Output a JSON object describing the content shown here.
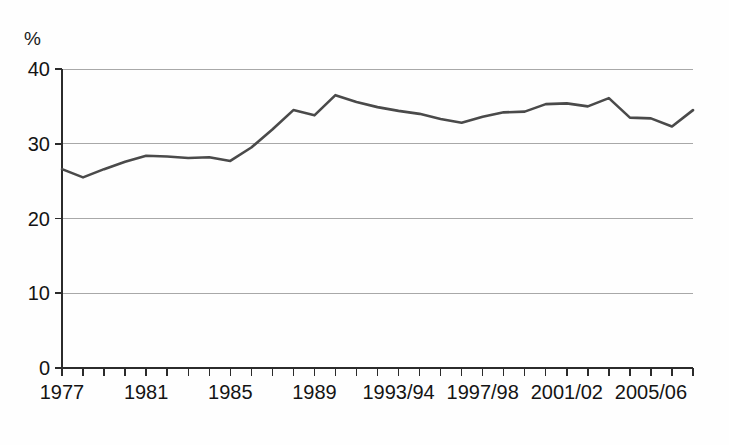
{
  "chart_data": {
    "type": "line",
    "title": "",
    "subtitle": "",
    "xlabel": "",
    "ylabel": "%",
    "ylim": [
      0,
      40
    ],
    "yticks": [
      0,
      10,
      20,
      30,
      40
    ],
    "ytick_labels": [
      "0",
      "10",
      "20",
      "30",
      "40"
    ],
    "grid": true,
    "legend": "none",
    "x_axis_note": "annual ticks, every 4th labelled; later years labelled as academic/financial year spans",
    "xtick_labels": [
      "1977",
      "1981",
      "1985",
      "1989",
      "1993/94",
      "1997/98",
      "2001/02",
      "2005/06"
    ],
    "xtick_label_years": [
      1977,
      1981,
      1985,
      1989,
      1993,
      1997,
      2001,
      2005
    ],
    "x": [
      1977,
      1978,
      1979,
      1980,
      1981,
      1982,
      1983,
      1984,
      1985,
      1986,
      1987,
      1988,
      1989,
      1990,
      1991,
      1992,
      1993,
      1994,
      1995,
      1996,
      1997,
      1998,
      1999,
      2000,
      2001,
      2002,
      2003,
      2004,
      2005,
      2006,
      2007
    ],
    "x_labels_full": [
      "1977",
      "1978",
      "1979",
      "1980",
      "1981",
      "1982",
      "1983",
      "1984",
      "1985",
      "1986",
      "1987",
      "1988",
      "1989",
      "1990",
      "1991",
      "1992",
      "1993/94",
      "1994/95",
      "1995/96",
      "1996/97",
      "1997/98",
      "1998/99",
      "1999/00",
      "2000/01",
      "2001/02",
      "2002/03",
      "2003/04",
      "2004/05",
      "2005/06",
      "2006/07",
      "2007/08"
    ],
    "values": [
      26.6,
      25.5,
      26.6,
      27.6,
      28.4,
      28.3,
      28.1,
      28.2,
      27.7,
      29.5,
      31.9,
      34.5,
      33.8,
      36.5,
      35.6,
      34.9,
      34.4,
      34.0,
      33.3,
      32.8,
      33.6,
      34.2,
      34.3,
      35.3,
      35.4,
      35.0,
      36.1,
      33.5,
      33.4,
      32.3,
      34.5
    ],
    "series": [
      {
        "name": "percentage",
        "color": "#4a4a4a",
        "values": [
          26.6,
          25.5,
          26.6,
          27.6,
          28.4,
          28.3,
          28.1,
          28.2,
          27.7,
          29.5,
          31.9,
          34.5,
          33.8,
          36.5,
          35.6,
          34.9,
          34.4,
          34.0,
          33.3,
          32.8,
          33.6,
          34.2,
          34.3,
          35.3,
          35.4,
          35.0,
          36.1,
          33.5,
          33.4,
          32.3,
          34.5
        ]
      }
    ],
    "colors": {
      "line": "#4a4a4a",
      "grid": "#a8a8a8",
      "axis": "#2b2b2b",
      "text": "#141414",
      "background": "#ffffff"
    }
  }
}
